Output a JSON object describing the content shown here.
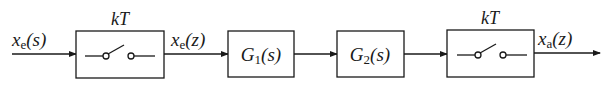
{
  "diagram": {
    "type": "block-diagram",
    "colors": {
      "stroke": "#1a1a1a",
      "background": "#ffffff"
    },
    "input_signal": {
      "var": "x",
      "sub": "e",
      "arg": "(s)"
    },
    "blocks": [
      {
        "id": "sampler1",
        "kind": "sampler-switch",
        "label_above": "kT"
      },
      {
        "id": "G1",
        "kind": "transfer-function",
        "name": "G",
        "sub": "1",
        "arg": "(s)"
      },
      {
        "id": "G2",
        "kind": "transfer-function",
        "name": "G",
        "sub": "2",
        "arg": "(s)"
      },
      {
        "id": "sampler2",
        "kind": "sampler-switch",
        "label_above": "kT"
      }
    ],
    "intermediate_signal": {
      "var": "x",
      "sub": "e",
      "arg": "(z)"
    },
    "output_signal": {
      "var": "x",
      "sub": "a",
      "arg": "(z)"
    }
  }
}
